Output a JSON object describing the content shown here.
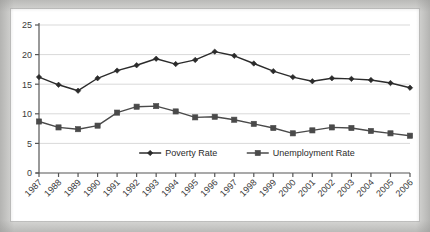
{
  "chart_data": {
    "type": "line",
    "title": "",
    "subtitle": "",
    "xlabel": "",
    "ylabel": "",
    "categories": [
      "1987",
      "1988",
      "1989",
      "1990",
      "1991",
      "1992",
      "1993",
      "1994",
      "1995",
      "1996",
      "1997",
      "1998",
      "1999",
      "2000",
      "2001",
      "2002",
      "2003",
      "2004",
      "2005",
      "2006"
    ],
    "x": [
      1987,
      1988,
      1989,
      1990,
      1991,
      1992,
      1993,
      1994,
      1995,
      1996,
      1997,
      1998,
      1999,
      2000,
      2001,
      2002,
      2003,
      2004,
      2005,
      2006
    ],
    "series": [
      {
        "name": "Poverty Rate",
        "marker": "diamond",
        "color": "#2b2b2b",
        "values": [
          16.2,
          14.9,
          13.9,
          16.0,
          17.3,
          18.2,
          19.3,
          18.4,
          19.1,
          20.5,
          19.8,
          18.5,
          17.2,
          16.2,
          15.5,
          16.0,
          15.9,
          15.7,
          15.2,
          14.4
        ]
      },
      {
        "name": "Unemployment Rate",
        "marker": "square",
        "color": "#4a4a4a",
        "values": [
          8.7,
          7.7,
          7.4,
          8.0,
          10.2,
          11.2,
          11.3,
          10.4,
          9.4,
          9.5,
          9.0,
          8.3,
          7.6,
          6.7,
          7.2,
          7.7,
          7.6,
          7.1,
          6.7,
          6.3
        ]
      }
    ],
    "ylim": [
      0,
      25
    ],
    "yticks": [
      0,
      5,
      10,
      15,
      20,
      25
    ],
    "ytick_labels": [
      "0",
      "5",
      "10",
      "15",
      "20",
      "25"
    ],
    "grid": true,
    "grid_axis": "y",
    "legend_position": "inside-bottom-center",
    "legend_entries": [
      "Poverty Rate",
      "Unemployment Rate"
    ]
  },
  "figure": {
    "background_color": "#d8d8d6",
    "plot_background_color": "#ffffff",
    "axis_color": "#555555",
    "grid_color": "#d9d9d9"
  }
}
